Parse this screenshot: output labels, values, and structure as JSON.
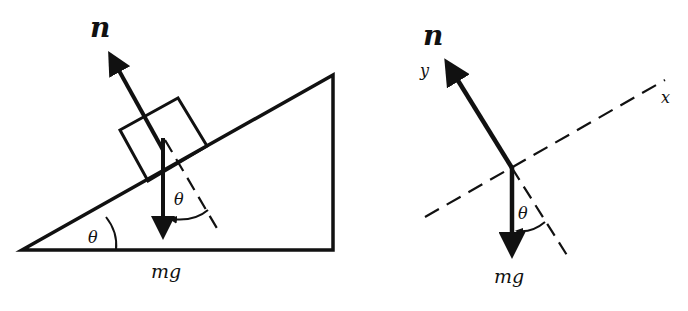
{
  "figure": {
    "left_panel": {
      "title": "block on incline",
      "normal_force_label": "n",
      "weight_label": "mg",
      "incline_angle_label": "θ",
      "weight_angle_label": "θ"
    },
    "right_panel": {
      "title": "free-body diagram",
      "normal_force_label": "n",
      "y_axis_label": "y",
      "x_axis_label": "x",
      "weight_label": "mg",
      "weight_angle_label": "θ"
    },
    "colors": {
      "ink": "#111111",
      "background": "#ffffff"
    }
  }
}
